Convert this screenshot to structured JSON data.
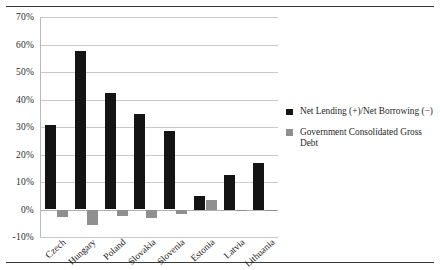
{
  "figure": {
    "top_rule": "",
    "bottom_rule": ""
  },
  "chart_data": {
    "type": "bar",
    "title": "",
    "xlabel": "",
    "ylabel": "",
    "ylim": [
      -10,
      70
    ],
    "ytick_labels": [
      "70%",
      "60%",
      "50%",
      "40%",
      "30%",
      "20%",
      "10%",
      "0%",
      "-10%"
    ],
    "yticks": [
      70,
      60,
      50,
      40,
      30,
      20,
      10,
      0,
      -10
    ],
    "grid": true,
    "legend_position": "right",
    "categories": [
      "Czech",
      "Hungary",
      "Poland",
      "Slovakia",
      "Slovenia",
      "Estonia",
      "Latvia",
      "Lithuania"
    ],
    "series": [
      {
        "name": "Net Lending (+)/Net Borrowing (−)",
        "color": "#141414",
        "values": [
          30.8,
          57.6,
          42.4,
          34.8,
          28.4,
          5.0,
          12.5,
          17.0
        ]
      },
      {
        "name": "Government Consolidated Gross Debt",
        "color": "#8f8f8f",
        "values": [
          -2.8,
          -5.5,
          -2.5,
          -3.0,
          -1.5,
          3.5,
          -0.6,
          -0.5
        ]
      }
    ]
  },
  "legend": {
    "items": [
      {
        "label": "Net Lending (+)/Net Borrowing (−)",
        "color": "#141414"
      },
      {
        "label": "Government Consolidated Gross Debt",
        "color": "#8f8f8f"
      }
    ]
  }
}
